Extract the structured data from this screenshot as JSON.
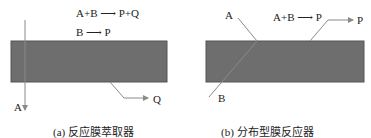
{
  "colors": {
    "membrane": "#6e6e6e",
    "membrane_border": "#555555",
    "arrow": "#8a8a8a",
    "text": "#222222"
  },
  "panel_a": {
    "reaction_1": "A+B ⟶ P+Q",
    "reaction_2": "B ⟶ P",
    "label_a": "A",
    "label_q": "Q",
    "caption": "(a) 反应膜萃取器"
  },
  "panel_b": {
    "reaction_1": "A+B ⟶ P",
    "label_a": "A",
    "label_b": "B",
    "label_p": "P",
    "caption": "(b) 分布型膜反应器"
  }
}
